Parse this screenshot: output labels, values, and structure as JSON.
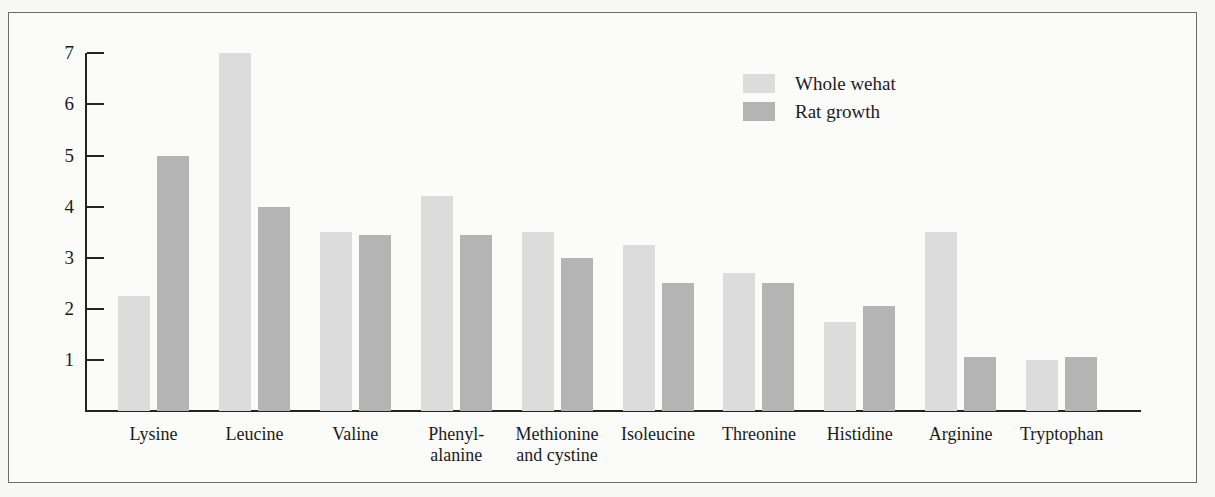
{
  "chart_data": {
    "type": "bar",
    "title": "",
    "subtitle": "",
    "xlabel": "",
    "ylabel": "",
    "ylim": [
      0,
      7
    ],
    "grid": false,
    "legend_position": "top-right",
    "y_ticks": [
      "7",
      "6",
      "5",
      "4",
      "3",
      "2",
      "1"
    ],
    "categories": [
      "Lysine",
      "Leucine",
      "Valine",
      "Phenyl-\nalanine",
      "Methionine\nand cystine",
      "Isoleucine",
      "Threonine",
      "Histidine",
      "Arginine",
      "Tryptophan"
    ],
    "category_lines": [
      [
        "Lysine"
      ],
      [
        "Leucine"
      ],
      [
        "Valine"
      ],
      [
        "Phenyl-",
        "alanine"
      ],
      [
        "Methionine",
        "and cystine"
      ],
      [
        "Isoleucine"
      ],
      [
        "Threonine"
      ],
      [
        "Histidine"
      ],
      [
        "Arginine"
      ],
      [
        "Tryptophan"
      ]
    ],
    "series": [
      {
        "name": "Whole wehat",
        "color": "#dcdcdc",
        "values": [
          2.25,
          7.0,
          3.5,
          4.2,
          3.5,
          3.25,
          2.7,
          1.75,
          3.5,
          1.0
        ]
      },
      {
        "name": "Rat growth",
        "color": "#b4b4b4",
        "values": [
          5.0,
          4.0,
          3.45,
          3.45,
          3.0,
          2.5,
          2.5,
          2.05,
          1.05,
          1.05
        ]
      }
    ]
  },
  "legend": {
    "items": [
      {
        "label": "Whole wehat",
        "swatch": "light"
      },
      {
        "label": "Rat growth",
        "swatch": "dark"
      }
    ]
  },
  "colors": {
    "light_bar": "#dcdcdc",
    "dark_bar": "#b4b4b4",
    "axis": "#232323",
    "frame": "#6e6e6e",
    "page_background": "#f7f7f5",
    "plot_background": "#fbfbfa",
    "text": "#1b1b1b"
  }
}
